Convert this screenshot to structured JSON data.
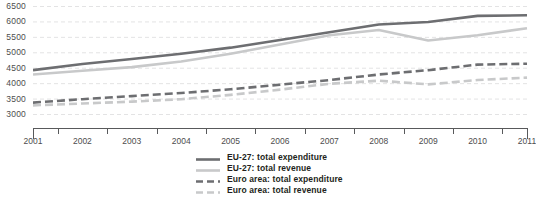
{
  "chart_data": {
    "type": "line",
    "title": "",
    "subtitle": "",
    "xlabel": "",
    "ylabel": "",
    "grid": true,
    "legend_position": "bottom-center",
    "x": [
      2001,
      2002,
      2003,
      2004,
      2005,
      2006,
      2007,
      2008,
      2009,
      2010,
      2011
    ],
    "xtick_labels": [
      "2001",
      "2002",
      "2003",
      "2004",
      "2005",
      "2006",
      "2007",
      "2008",
      "2009",
      "2010",
      "2011"
    ],
    "ytick_labels": [
      "6500",
      "6000",
      "5500",
      "5000",
      "4500",
      "4000",
      "3500",
      "3000"
    ],
    "ytick_values": [
      6500,
      6000,
      5500,
      5000,
      4500,
      4000,
      3500,
      3000
    ],
    "ylim": [
      3000,
      6500
    ],
    "xlim": [
      2001,
      2011
    ],
    "series": [
      {
        "name": "EU-27: total expenditure",
        "color": "#6d6e71",
        "style": "solid",
        "width": 2.6,
        "values": [
          4420,
          4620,
          4780,
          4950,
          5150,
          5400,
          5650,
          5900,
          5980,
          6180,
          6200
        ]
      },
      {
        "name": "EU-27: total revenue",
        "color": "#c8c9ca",
        "style": "solid",
        "width": 2.6,
        "values": [
          4280,
          4400,
          4520,
          4700,
          4950,
          5250,
          5550,
          5720,
          5380,
          5550,
          5780
        ]
      },
      {
        "name": "Euro area: total expenditure",
        "color": "#6d6e71",
        "style": "dashed",
        "width": 2.6,
        "values": [
          3370,
          3480,
          3580,
          3680,
          3800,
          3950,
          4100,
          4280,
          4420,
          4600,
          4630
        ]
      },
      {
        "name": "Euro area: total revenue",
        "color": "#c8c9ca",
        "style": "dashed",
        "width": 2.6,
        "values": [
          3280,
          3340,
          3400,
          3480,
          3620,
          3790,
          3980,
          4080,
          3960,
          4100,
          4180
        ]
      }
    ]
  },
  "legend": {
    "items": [
      {
        "label": "EU-27: total expenditure"
      },
      {
        "label": "EU-27: total revenue"
      },
      {
        "label": "Euro area: total expenditure"
      },
      {
        "label": "Euro area: total revenue"
      }
    ]
  },
  "colors": {
    "dark_gray": "#6d6e71",
    "light_gray": "#c8c9ca",
    "axis": "#58595b",
    "grid": "#e3e3e4",
    "text": "#4d4d4d",
    "legend_text": "#231f20",
    "background": "#ffffff"
  }
}
